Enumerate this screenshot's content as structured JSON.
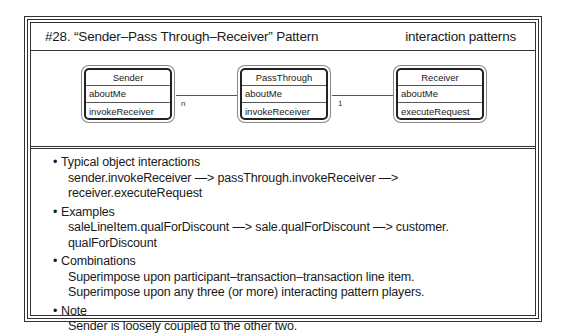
{
  "header": {
    "title": "#28. “Sender–Pass Through–Receiver” Pattern",
    "category": "interaction patterns"
  },
  "diagram": {
    "classes": [
      {
        "name": "Sender",
        "attribute": "aboutMe",
        "service": "invokeReceiver"
      },
      {
        "name": "PassThrough",
        "attribute": "aboutMe",
        "service": "invokeReceiver"
      },
      {
        "name": "Receiver",
        "attribute": "aboutMe",
        "service": "executeRequest"
      }
    ],
    "links": [
      {
        "from": "Sender",
        "to": "PassThrough",
        "multiplicity": "n"
      },
      {
        "from": "PassThrough",
        "to": "Receiver",
        "multiplicity": "1"
      }
    ]
  },
  "notes": [
    {
      "heading": "Typical object interactions",
      "lines": [
        "sender.invokeReceiver —> passThrough.invokeReceiver —> receiver.executeRequest"
      ]
    },
    {
      "heading": "Examples",
      "lines": [
        "saleLineItem.qualForDiscount —> sale.qualForDiscount —> customer. qualForDiscount"
      ]
    },
    {
      "heading": "Combinations",
      "lines": [
        "Superimpose upon participant–transaction–transaction line item.",
        "Superimpose upon any three (or more) interacting pattern players."
      ]
    },
    {
      "heading": "Note",
      "lines": [
        "Sender is loosely coupled to the other two."
      ]
    }
  ],
  "bullet": "•"
}
